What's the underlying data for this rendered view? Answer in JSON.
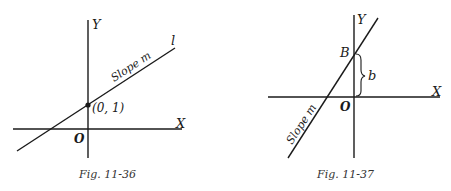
{
  "figures": [
    {
      "id": "fig-11-36",
      "caption": "Fig. 11-36",
      "labels": {
        "y_axis": "Y",
        "x_axis": "X",
        "origin": "O",
        "line_name": "l",
        "slope": "Slope m",
        "point": "(0, 1)"
      }
    },
    {
      "id": "fig-11-37",
      "caption": "Fig. 11-37",
      "labels": {
        "y_axis": "Y",
        "x_axis": "X",
        "origin": "O",
        "intercept_point": "B",
        "intercept_length": "b",
        "slope": "Slope m"
      }
    }
  ],
  "colors": {
    "ink": "#1a1a1a",
    "background": "#ffffff"
  }
}
